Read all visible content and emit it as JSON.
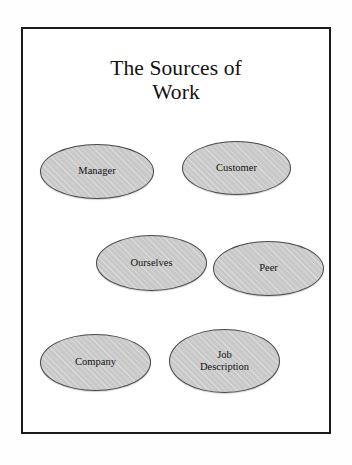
{
  "slide": {
    "title_lines": [
      "The Sources of",
      "Work"
    ],
    "title_full": "The Sources of Work",
    "background_color": "#ffffff",
    "frame_color": "#1b1b1b"
  },
  "diagram": {
    "type": "concept-map",
    "node_fill_color": "#c9c9c9",
    "node_outline_color": "#4a4a4a",
    "node_text_color": "#111111",
    "nodes": [
      {
        "id": "manager",
        "label": "Manager",
        "label_lines": [
          "Manager"
        ]
      },
      {
        "id": "customer",
        "label": "Customer",
        "label_lines": [
          "Customer"
        ]
      },
      {
        "id": "ourselves",
        "label": "Ourselves",
        "label_lines": [
          "Ourselves"
        ]
      },
      {
        "id": "peer",
        "label": "Peer",
        "label_lines": [
          "Peer"
        ]
      },
      {
        "id": "company",
        "label": "Company",
        "label_lines": [
          "Company"
        ]
      },
      {
        "id": "job_description",
        "label": "Job Description",
        "label_lines": [
          "Job",
          "Description"
        ]
      }
    ]
  }
}
